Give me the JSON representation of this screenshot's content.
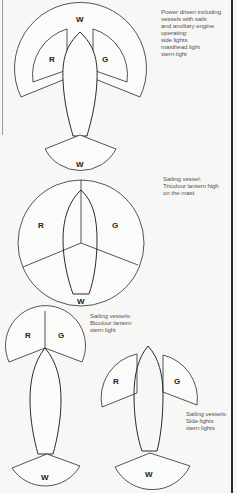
{
  "figures": [
    {
      "id": "power-driven",
      "caption_lines": [
        "Power driven including",
        "vessels with sails",
        "and anxiliary engine",
        "operating:",
        "side lights",
        "masthead light",
        "stern light"
      ],
      "labels": {
        "masthead": "W",
        "port": "R",
        "starboard": "G",
        "stern": "W"
      }
    },
    {
      "id": "tricolour",
      "caption_lines": [
        "Sailing vessel:",
        "Tricolour lantern high",
        "on the mast"
      ],
      "labels": {
        "port": "R",
        "starboard": "G",
        "stern": "W"
      }
    },
    {
      "id": "bicolour",
      "caption_lines": [
        "Sailing vessels:",
        "Bicolour lantern",
        "stern light"
      ],
      "labels": {
        "port": "R",
        "starboard": "G",
        "stern": "W"
      }
    },
    {
      "id": "side-lights",
      "caption_lines": [
        "Sailing vessels:",
        "Side lights",
        "stern lights"
      ],
      "labels": {
        "port": "R",
        "starboard": "G",
        "stern": "W"
      }
    }
  ],
  "colors": {
    "background": "#f7f7f6",
    "line": "#2a2a2a",
    "text": "#555555"
  }
}
